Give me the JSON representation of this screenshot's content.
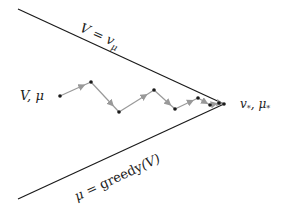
{
  "labels": {
    "upper_line": "V = vμ",
    "lower_line": "μ = greedy(V)",
    "start": "V,  μ",
    "end": "v*,  μ*"
  },
  "colors": {
    "line": "#1a1a1a",
    "arrow": "#999999",
    "point": "#1a1a1a"
  },
  "path_points": [
    [
      60,
      96
    ],
    [
      91,
      82
    ],
    [
      119,
      112
    ],
    [
      154,
      90
    ],
    [
      175,
      109
    ],
    [
      198,
      98
    ],
    [
      210,
      105
    ],
    [
      219,
      103
    ],
    [
      224,
      104
    ]
  ]
}
